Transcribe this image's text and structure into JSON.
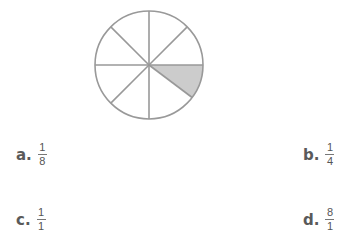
{
  "figure": {
    "type": "fraction-circle",
    "total_parts": 8,
    "shaded_parts": 1,
    "stroke_color": "#999999",
    "shade_color": "#cccccc"
  },
  "options": [
    {
      "letter": "a.",
      "numerator": "1",
      "denominator": "8"
    },
    {
      "letter": "b.",
      "numerator": "1",
      "denominator": "4"
    },
    {
      "letter": "c.",
      "numerator": "1",
      "denominator": "1"
    },
    {
      "letter": "d.",
      "numerator": "8",
      "denominator": "1"
    }
  ]
}
